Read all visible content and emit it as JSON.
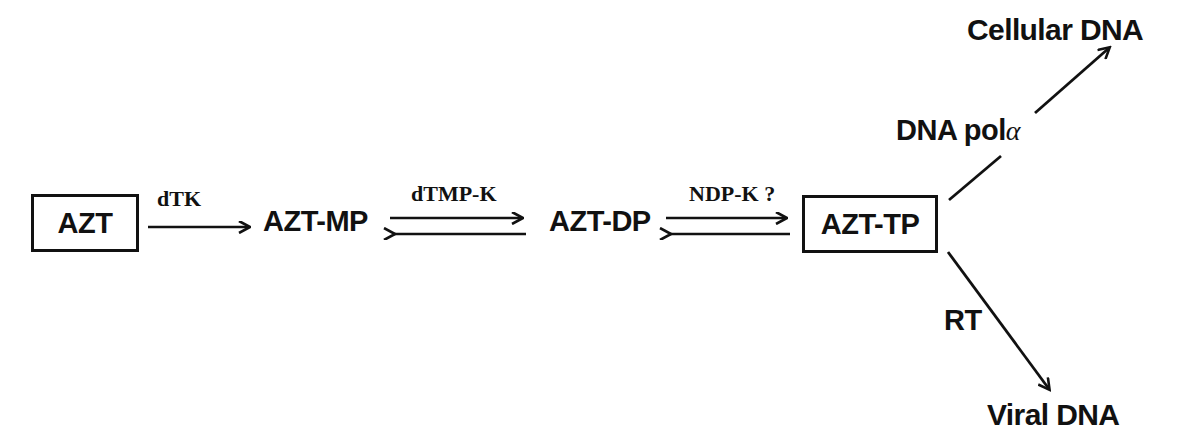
{
  "diagram": {
    "ink_color": "#111111",
    "background_color": "#ffffff",
    "nodes": [
      {
        "id": "azt",
        "label": "AZT",
        "boxed": true
      },
      {
        "id": "azt_mp",
        "label": "AZT-MP",
        "boxed": false
      },
      {
        "id": "azt_dp",
        "label": "AZT-DP",
        "boxed": false
      },
      {
        "id": "azt_tp",
        "label": "AZT-TP",
        "boxed": true
      }
    ],
    "steps": [
      {
        "id": "step1",
        "enzyme": "dTK",
        "reversible": false
      },
      {
        "id": "step2",
        "enzyme": "dTMP-K",
        "reversible": true
      },
      {
        "id": "step3",
        "enzyme": "NDP-K ?",
        "reversible": true
      }
    ],
    "branches": [
      {
        "id": "branch_cellular",
        "enzyme": "DNA pol",
        "enzyme_symbol": "a",
        "product": "Cellular DNA",
        "direction": "up"
      },
      {
        "id": "branch_viral",
        "enzyme": "RT",
        "enzyme_symbol": "",
        "product": "Viral DNA",
        "direction": "down"
      }
    ]
  }
}
